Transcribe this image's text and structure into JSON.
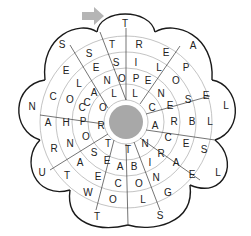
{
  "puzzle": {
    "type": "word-flower",
    "center_color": "#a8a8a8",
    "arrow_color": "#b5b5b5",
    "start_arrow": "right-arrow-icon",
    "letters": [
      {
        "ch": "T",
        "x": 125,
        "y": 24
      },
      {
        "ch": "T",
        "x": 112,
        "y": 45
      },
      {
        "ch": "R",
        "x": 139,
        "y": 45
      },
      {
        "ch": "S",
        "x": 116,
        "y": 63
      },
      {
        "ch": "I",
        "x": 136,
        "y": 63
      },
      {
        "ch": "O",
        "x": 122,
        "y": 79
      },
      {
        "ch": "P",
        "x": 136,
        "y": 79
      },
      {
        "ch": "N",
        "x": 107,
        "y": 81
      },
      {
        "ch": "E",
        "x": 148,
        "y": 81
      },
      {
        "ch": "L",
        "x": 114,
        "y": 94
      },
      {
        "ch": "L",
        "x": 135,
        "y": 94
      },
      {
        "ch": "S",
        "x": 62,
        "y": 45
      },
      {
        "ch": "S",
        "x": 89,
        "y": 54
      },
      {
        "ch": "E",
        "x": 66,
        "y": 71
      },
      {
        "ch": "E",
        "x": 96,
        "y": 68
      },
      {
        "ch": "L",
        "x": 79,
        "y": 84
      },
      {
        "ch": "A",
        "x": 94,
        "y": 93
      },
      {
        "ch": "E",
        "x": 166,
        "y": 53
      },
      {
        "ch": "A",
        "x": 193,
        "y": 46
      },
      {
        "ch": "L",
        "x": 159,
        "y": 68
      },
      {
        "ch": "P",
        "x": 186,
        "y": 68
      },
      {
        "ch": "O",
        "x": 176,
        "y": 81
      },
      {
        "ch": "N",
        "x": 161,
        "y": 94
      },
      {
        "ch": "N",
        "x": 32,
        "y": 107
      },
      {
        "ch": "C",
        "x": 53,
        "y": 97
      },
      {
        "ch": "O",
        "x": 70,
        "y": 100
      },
      {
        "ch": "C",
        "x": 87,
        "y": 103
      },
      {
        "ch": "O",
        "x": 103,
        "y": 108
      },
      {
        "ch": "C",
        "x": 82,
        "y": 108
      },
      {
        "ch": "C",
        "x": 152,
        "y": 108
      },
      {
        "ch": "E",
        "x": 170,
        "y": 106
      },
      {
        "ch": "S",
        "x": 188,
        "y": 100
      },
      {
        "ch": "E",
        "x": 206,
        "y": 96
      },
      {
        "ch": "L",
        "x": 226,
        "y": 106
      },
      {
        "ch": "A",
        "x": 48,
        "y": 123
      },
      {
        "ch": "H",
        "x": 66,
        "y": 123
      },
      {
        "ch": "P",
        "x": 83,
        "y": 122
      },
      {
        "ch": "R",
        "x": 101,
        "y": 126
      },
      {
        "ch": "A",
        "x": 155,
        "y": 126
      },
      {
        "ch": "R",
        "x": 174,
        "y": 122
      },
      {
        "ch": "B",
        "x": 192,
        "y": 122
      },
      {
        "ch": "L",
        "x": 210,
        "y": 122
      },
      {
        "ch": "R",
        "x": 54,
        "y": 149
      },
      {
        "ch": "N",
        "x": 70,
        "y": 144
      },
      {
        "ch": "O",
        "x": 86,
        "y": 137
      },
      {
        "ch": "T",
        "x": 108,
        "y": 144
      },
      {
        "ch": "T",
        "x": 128,
        "y": 150
      },
      {
        "ch": "N",
        "x": 145,
        "y": 144
      },
      {
        "ch": "C",
        "x": 168,
        "y": 138
      },
      {
        "ch": "E",
        "x": 186,
        "y": 144
      },
      {
        "ch": "S",
        "x": 204,
        "y": 150
      },
      {
        "ch": "S",
        "x": 94,
        "y": 153
      },
      {
        "ch": "R",
        "x": 161,
        "y": 154
      },
      {
        "ch": "U",
        "x": 42,
        "y": 173
      },
      {
        "ch": "T",
        "x": 67,
        "y": 176
      },
      {
        "ch": "A",
        "x": 80,
        "y": 163
      },
      {
        "ch": "E",
        "x": 107,
        "y": 161
      },
      {
        "ch": "A",
        "x": 120,
        "y": 167
      },
      {
        "ch": "B",
        "x": 134,
        "y": 167
      },
      {
        "ch": "I",
        "x": 150,
        "y": 163
      },
      {
        "ch": "A",
        "x": 176,
        "y": 163
      },
      {
        "ch": "E",
        "x": 192,
        "y": 175
      },
      {
        "ch": "L",
        "x": 218,
        "y": 173
      },
      {
        "ch": "E",
        "x": 98,
        "y": 177
      },
      {
        "ch": "C",
        "x": 118,
        "y": 184
      },
      {
        "ch": "O",
        "x": 139,
        "y": 184
      },
      {
        "ch": "N",
        "x": 156,
        "y": 178
      },
      {
        "ch": "W",
        "x": 88,
        "y": 193
      },
      {
        "ch": "O",
        "x": 113,
        "y": 200
      },
      {
        "ch": "L",
        "x": 143,
        "y": 200
      },
      {
        "ch": "G",
        "x": 168,
        "y": 193
      },
      {
        "ch": "T",
        "x": 97,
        "y": 217
      },
      {
        "ch": "S",
        "x": 160,
        "y": 216
      }
    ]
  }
}
